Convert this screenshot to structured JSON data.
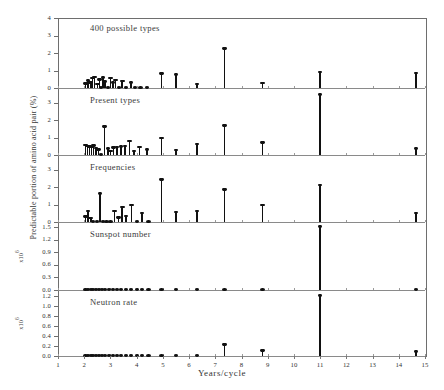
{
  "figure": {
    "xlabel": "Years/cycle",
    "ylabel": "Predictable portion of amino acid pair (%)",
    "exponent_label": "x10",
    "exponent_sup": "6"
  },
  "chart_data": {
    "type": "scatter",
    "title": "",
    "xlabel": "Years/cycle",
    "ylabel": "Predictable portion of amino acid pair (%)",
    "xlim": [
      1,
      15
    ],
    "xticks": [
      1,
      2,
      3,
      4,
      5,
      6,
      7,
      8,
      9,
      10,
      11,
      12,
      13,
      14,
      15
    ],
    "grid": false,
    "legend": "none",
    "panels": [
      {
        "name": "panel-400-possible-types",
        "label": "400 possible types",
        "ylim": [
          0,
          4
        ],
        "yticks": [
          0,
          1,
          2,
          3,
          4
        ],
        "ytick_labels": [
          "0",
          "1",
          "2",
          "3",
          "4"
        ],
        "x": [
          2.05,
          2.15,
          2.25,
          2.32,
          2.4,
          2.5,
          2.58,
          2.65,
          2.72,
          2.8,
          2.9,
          3.0,
          3.1,
          3.2,
          3.32,
          3.45,
          3.6,
          3.78,
          3.95,
          4.15,
          4.4,
          4.95,
          5.5,
          6.3,
          7.35,
          8.8,
          11.0,
          14.65
        ],
        "y": [
          0.25,
          0.42,
          0.3,
          0.55,
          0.62,
          0.2,
          0.48,
          0.15,
          0.58,
          0.35,
          0.12,
          0.55,
          0.3,
          0.45,
          0.18,
          0.38,
          0.1,
          0.3,
          0.12,
          0.1,
          0.1,
          0.82,
          0.75,
          0.2,
          2.25,
          0.28,
          0.9,
          0.85
        ]
      },
      {
        "name": "panel-present-types",
        "label": "Present types",
        "ylim": [
          0,
          3.6
        ],
        "yticks": [
          0,
          1,
          2,
          3
        ],
        "ytick_labels": [
          "0",
          "1",
          "2",
          "3"
        ],
        "x": [
          2.05,
          2.12,
          2.2,
          2.28,
          2.36,
          2.45,
          2.55,
          2.65,
          2.78,
          2.9,
          3.0,
          3.12,
          3.25,
          3.4,
          3.55,
          3.72,
          3.9,
          4.1,
          4.4,
          4.95,
          5.5,
          6.3,
          7.35,
          8.8,
          11.0,
          14.65
        ],
        "y": [
          0.55,
          0.5,
          0.48,
          0.45,
          0.52,
          0.38,
          0.3,
          0.12,
          1.62,
          0.35,
          0.2,
          0.42,
          0.45,
          0.48,
          0.5,
          0.78,
          0.2,
          0.45,
          0.3,
          0.95,
          0.28,
          0.62,
          1.68,
          0.7,
          3.45,
          0.35
        ]
      },
      {
        "name": "panel-frequencies",
        "label": "Frequencies",
        "ylim": [
          0,
          3.6
        ],
        "yticks": [
          0,
          1,
          2,
          3
        ],
        "ytick_labels": [
          "0",
          "1",
          "2",
          "3"
        ],
        "x": [
          2.05,
          2.15,
          2.25,
          2.35,
          2.48,
          2.6,
          2.72,
          2.85,
          3.0,
          3.15,
          3.3,
          3.45,
          3.6,
          3.8,
          4.0,
          4.2,
          4.45,
          4.95,
          5.5,
          6.3,
          7.35,
          8.8,
          11.0,
          14.65
        ],
        "y": [
          0.3,
          0.62,
          0.22,
          0.15,
          0.12,
          1.6,
          0.1,
          0.12,
          0.15,
          0.6,
          0.25,
          0.85,
          0.32,
          0.95,
          0.15,
          0.5,
          0.12,
          2.4,
          0.55,
          0.6,
          1.85,
          0.95,
          2.1,
          0.5
        ]
      },
      {
        "name": "panel-sunspot-number",
        "label": "Sunspot number",
        "ylim": [
          0,
          1.5
        ],
        "yticks": [
          0.0,
          0.3,
          0.6,
          0.9,
          1.2,
          1.5
        ],
        "ytick_labels": [
          "0.0",
          "0.3",
          "0.6",
          "0.9",
          "1.2",
          "1.5"
        ],
        "x": [
          2.05,
          2.15,
          2.25,
          2.35,
          2.45,
          2.55,
          2.68,
          2.8,
          2.95,
          3.1,
          3.25,
          3.4,
          3.6,
          3.8,
          4.0,
          4.2,
          4.45,
          4.95,
          5.5,
          6.3,
          7.35,
          8.8,
          11.0,
          14.65
        ],
        "y": [
          0.02,
          0.02,
          0.02,
          0.02,
          0.02,
          0.02,
          0.02,
          0.02,
          0.02,
          0.02,
          0.02,
          0.02,
          0.02,
          0.02,
          0.02,
          0.02,
          0.02,
          0.02,
          0.06,
          0.02,
          0.02,
          0.02,
          1.5,
          0.02
        ]
      },
      {
        "name": "panel-neutron-rate",
        "label": "Neutron rate",
        "ylim": [
          0,
          1.3
        ],
        "yticks": [
          0.0,
          0.2,
          0.4,
          0.6,
          0.8,
          1.0,
          1.2
        ],
        "ytick_labels": [
          "0.0",
          "0.2",
          "0.4",
          "0.6",
          "0.8",
          "1.0",
          "1.2"
        ],
        "x": [
          2.05,
          2.15,
          2.25,
          2.35,
          2.45,
          2.55,
          2.68,
          2.8,
          2.95,
          3.1,
          3.25,
          3.4,
          3.6,
          3.8,
          4.0,
          4.2,
          4.45,
          4.95,
          5.5,
          6.3,
          7.35,
          8.8,
          11.0,
          14.65
        ],
        "y": [
          0.02,
          0.02,
          0.02,
          0.02,
          0.02,
          0.02,
          0.02,
          0.02,
          0.02,
          0.02,
          0.02,
          0.02,
          0.02,
          0.02,
          0.02,
          0.02,
          0.02,
          0.04,
          0.06,
          0.03,
          0.22,
          0.1,
          1.2,
          0.08
        ]
      }
    ]
  }
}
